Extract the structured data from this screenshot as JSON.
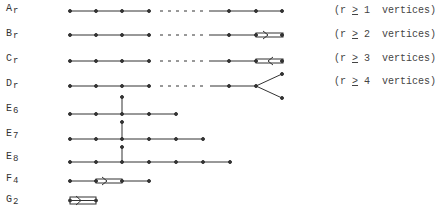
{
  "diagrams": [
    {
      "letter": "A",
      "sub": "r",
      "y": 11,
      "note_prefix": "(r ",
      "ge": ">",
      "note_num": "1",
      "note_suffix": "  vertices)"
    },
    {
      "letter": "B",
      "sub": "r",
      "y": 35,
      "note_prefix": "(r ",
      "ge": ">",
      "note_num": "2",
      "note_suffix": "  vertices)"
    },
    {
      "letter": "C",
      "sub": "r",
      "y": 61,
      "note_prefix": "(r ",
      "ge": ">",
      "note_num": "3",
      "note_suffix": "  vertices)"
    },
    {
      "letter": "D",
      "sub": "r",
      "y": 86,
      "note_prefix": "(r ",
      "ge": ">",
      "note_num": "4",
      "note_suffix": "  vertices)"
    },
    {
      "letter": "E",
      "sub": "6",
      "y": 114
    },
    {
      "letter": "E",
      "sub": "7",
      "y": 139
    },
    {
      "letter": "E",
      "sub": "8",
      "y": 162
    },
    {
      "letter": "F",
      "sub": "4",
      "y": 181
    },
    {
      "letter": "G",
      "sub": "2",
      "y": 200
    }
  ],
  "colors": {
    "ink": "#333333",
    "background": "#ffffff"
  }
}
